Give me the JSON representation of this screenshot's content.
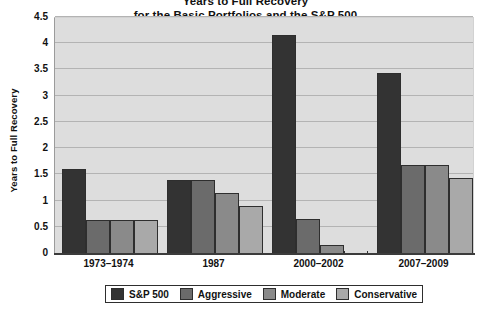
{
  "chart_data": {
    "type": "bar",
    "title": "Years to Full Recovery for the Basic Portfolios and the S&P 500",
    "title_line1": "Years to Full Recovery",
    "title_line2": "for the Basic Portfolios and the S&P 500",
    "xlabel": "",
    "ylabel": "Years to Full Recovery",
    "categories": [
      "1973–1974",
      "1987",
      "2000–2002",
      "2007–2009"
    ],
    "series": [
      {
        "name": "S&P 500",
        "color": "#333333",
        "values": [
          1.63,
          1.42,
          4.17,
          3.45
        ]
      },
      {
        "name": "Aggressive",
        "color": "#6b6b6b",
        "values": [
          0.65,
          1.42,
          0.67,
          1.7
        ]
      },
      {
        "name": "Moderate",
        "color": "#8a8a8a",
        "values": [
          0.65,
          1.17,
          0.17,
          1.7
        ]
      },
      {
        "name": "Conservative",
        "color": "#a9a9a9",
        "values": [
          0.65,
          0.92,
          0.0,
          1.45
        ]
      }
    ],
    "ylim": [
      0,
      4.5
    ],
    "yticks": [
      "0",
      "0.5",
      "1",
      "1.5",
      "2",
      "2.5",
      "3",
      "3.5",
      "4",
      "4.5"
    ],
    "ytick_values": [
      0,
      0.5,
      1,
      1.5,
      2,
      2.5,
      3,
      3.5,
      4,
      4.5
    ],
    "grid": true,
    "legend_position": "bottom",
    "plot_background": "#dddddd",
    "gridline_color": "#b3b3b3",
    "axis_color": "#3b3b3b"
  },
  "legend": {
    "items": [
      {
        "label": "S&P 500"
      },
      {
        "label": "Aggressive"
      },
      {
        "label": "Moderate"
      },
      {
        "label": "Conservative"
      }
    ]
  }
}
